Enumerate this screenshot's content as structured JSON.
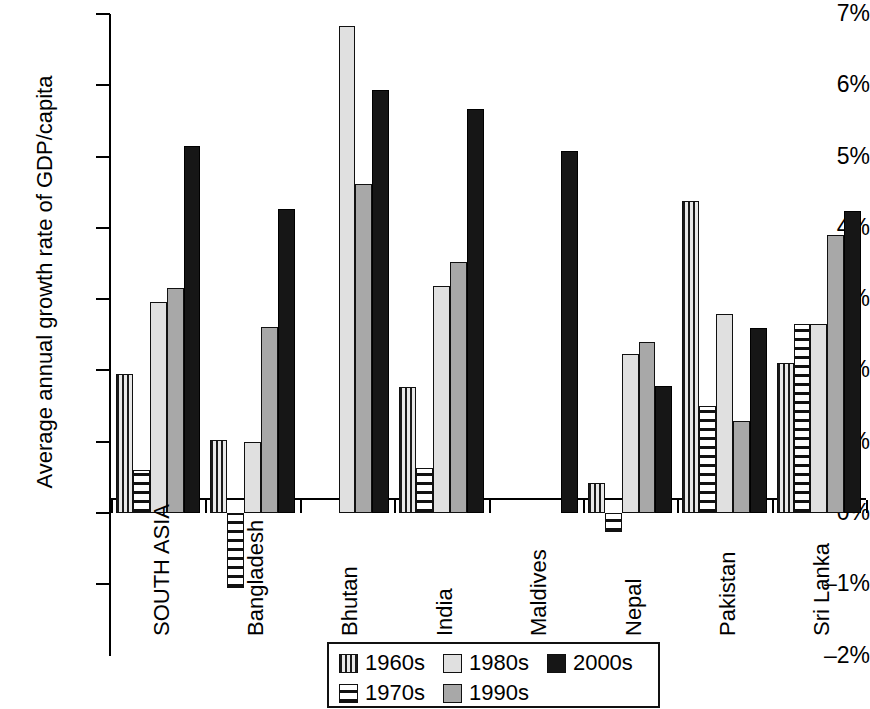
{
  "chart_data": {
    "type": "bar",
    "title": "",
    "xlabel": "",
    "ylabel": "Average annual growth rate of GDP/capita",
    "ylim": [
      -2,
      7
    ],
    "ytick_labels": [
      "7%",
      "6%",
      "5%",
      "4%",
      "3%",
      "2%",
      "1%",
      "0%",
      "–1%",
      "–2%"
    ],
    "ytick_values": [
      7,
      6,
      5,
      4,
      3,
      2,
      1,
      0,
      -1,
      -2
    ],
    "grid": false,
    "legend_position": "bottom-center",
    "categories": [
      "SOUTH ASIA",
      "Bangladesh",
      "Bhutan",
      "India",
      "Maldives",
      "Nepal",
      "Pakistan",
      "Sri Lanka"
    ],
    "series": [
      {
        "name": "1960s",
        "pattern": "vertical-stripes",
        "color": "#d8d8d8",
        "values": [
          1.95,
          1.02,
          null,
          1.77,
          null,
          0.42,
          4.38,
          2.1
        ]
      },
      {
        "name": "1970s",
        "pattern": "horizontal-stripes",
        "color": "#ffffff",
        "values": [
          0.6,
          -1.05,
          null,
          0.63,
          null,
          -0.27,
          1.5,
          2.65
        ]
      },
      {
        "name": "1980s",
        "pattern": "solid",
        "color": "#e0e0e0",
        "values": [
          2.96,
          1.0,
          6.83,
          3.18,
          null,
          2.23,
          2.79,
          2.65
        ]
      },
      {
        "name": "1990s",
        "pattern": "solid",
        "color": "#a8a8a8",
        "values": [
          3.16,
          2.61,
          4.62,
          3.52,
          null,
          2.4,
          1.29,
          3.9
        ]
      },
      {
        "name": "2000s",
        "pattern": "solid",
        "color": "#161616",
        "values": [
          5.15,
          4.27,
          5.94,
          5.67,
          5.08,
          1.78,
          2.6,
          4.24
        ]
      }
    ]
  },
  "legend": {
    "rows": [
      [
        {
          "label": "1960s",
          "series": 0
        },
        {
          "label": "1980s",
          "series": 2
        },
        {
          "label": "2000s",
          "series": 4
        }
      ],
      [
        {
          "label": "1970s",
          "series": 1
        },
        {
          "label": "1990s",
          "series": 3
        }
      ]
    ]
  }
}
